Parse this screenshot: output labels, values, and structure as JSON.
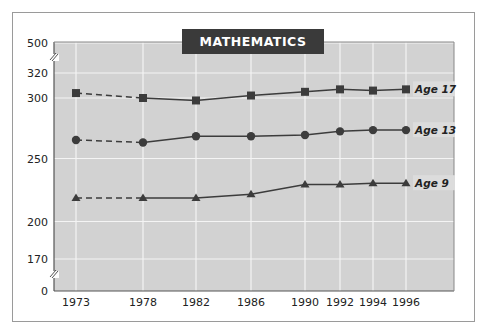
{
  "chart_data": {
    "type": "line",
    "title": "MATHEMATICS",
    "xlabel": "",
    "ylabel": "",
    "x": [
      "1973",
      "1978",
      "1982",
      "1986",
      "1990",
      "1992",
      "1994",
      "1996"
    ],
    "y_ticks": [
      "500",
      "320",
      "300",
      "250",
      "200",
      "170",
      "0"
    ],
    "y_axis_break": "between 320 and 500, and between 0 and 170",
    "ylim": [
      170,
      320
    ],
    "grid": true,
    "dashed_segment": "1973 to 1978 (all series)",
    "series": [
      {
        "name": "Age 17",
        "marker": "square",
        "values": [
          304,
          300,
          298,
          302,
          305,
          307,
          306,
          307
        ]
      },
      {
        "name": "Age 13",
        "marker": "circle",
        "values": [
          266,
          264,
          269,
          269,
          270,
          273,
          274,
          274
        ]
      },
      {
        "name": "Age 9",
        "marker": "triangle",
        "values": [
          219,
          219,
          219,
          222,
          230,
          230,
          231,
          231
        ]
      }
    ],
    "legend": "inline labels at right end of each line"
  },
  "colors": {
    "plot_background": "#d2d2d2",
    "gridline": "#f4f4f4",
    "line": "#3c3c3c",
    "title_box": "#3a3a3a",
    "title_text": "#ffffff"
  }
}
